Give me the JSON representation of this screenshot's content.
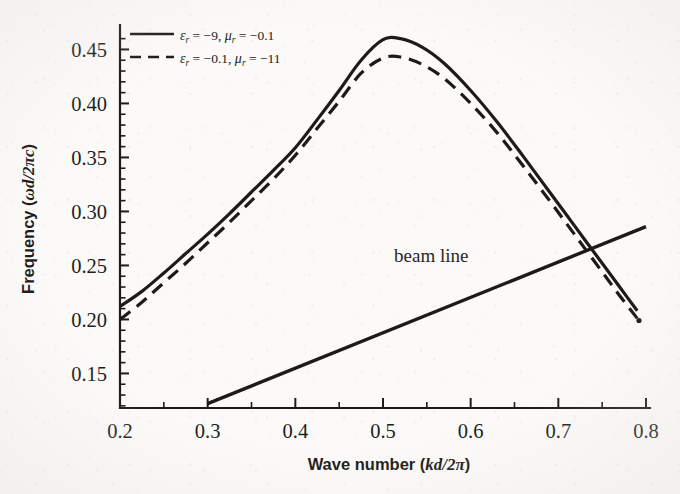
{
  "figure": {
    "background_color": "#fbfaf8",
    "ink_color": "#1d1b19",
    "style": "scanned-grayscale-figure"
  },
  "axes": {
    "x": {
      "label_prefix": "Wave number (",
      "label_symbol": "kd/2π",
      "label_suffix": ")",
      "label_full": "Wave number (kd/2π)",
      "ticks": [
        "0.2",
        "0.3",
        "0.4",
        "0.5",
        "0.6",
        "0.7",
        "0.8"
      ],
      "tick_values": [
        0.2,
        0.3,
        0.4,
        0.5,
        0.6,
        0.7,
        0.8
      ],
      "minor_ticks_per_interval": 1,
      "range": [
        0.2,
        0.8
      ]
    },
    "y": {
      "label_prefix": "Frequency (",
      "label_symbol": "ωd/2πc",
      "label_suffix": ")",
      "label_full": "Frequency (ωd/2πc)",
      "ticks": [
        "0.15",
        "0.20",
        "0.25",
        "0.30",
        "0.35",
        "0.40",
        "0.45"
      ],
      "tick_values": [
        0.15,
        0.2,
        0.25,
        0.3,
        0.35,
        0.4,
        0.45
      ],
      "minor_ticks_per_interval": 4,
      "range": [
        0.118,
        0.468
      ]
    }
  },
  "legend": {
    "position": "top-left-inside",
    "entries": [
      {
        "sample": "solid-line",
        "eps_symbol": "ε",
        "eps_sub": "r",
        "eps_value": "= −9",
        "separator": ",",
        "mu_symbol": "μ",
        "mu_sub": "r",
        "mu_value": "= −0.1",
        "text_full": "εr = −9, μr = −0.1"
      },
      {
        "sample": "dashed-line",
        "eps_symbol": "ε",
        "eps_sub": "r",
        "eps_value": "= −0.1",
        "separator": ",",
        "mu_symbol": "μ",
        "mu_sub": "r",
        "mu_value": "= −11",
        "text_full": "εr = −0.1, μr = −11"
      }
    ]
  },
  "annotations": [
    {
      "name": "beam-line-label",
      "text": "beam line",
      "x_data": 0.555,
      "y_data": 0.253
    }
  ],
  "chart_data": {
    "type": "line",
    "title": "",
    "xlabel": "Wave number (kd/2π)",
    "ylabel": "Frequency (ωd/2πc)",
    "xlim": [
      0.2,
      0.8
    ],
    "ylim": [
      0.118,
      0.468
    ],
    "grid": false,
    "legend_position": "upper left",
    "series": [
      {
        "name": "εr = −9, μr = −0.1",
        "style": "solid",
        "color": "#1d1b19",
        "x": [
          0.2,
          0.225,
          0.25,
          0.275,
          0.3,
          0.325,
          0.35,
          0.375,
          0.4,
          0.425,
          0.45,
          0.475,
          0.5,
          0.52,
          0.545,
          0.57,
          0.6,
          0.63,
          0.66,
          0.69,
          0.72,
          0.75,
          0.77,
          0.79
        ],
        "y": [
          0.212,
          0.226,
          0.243,
          0.261,
          0.279,
          0.298,
          0.318,
          0.338,
          0.359,
          0.385,
          0.412,
          0.44,
          0.459,
          0.46,
          0.452,
          0.437,
          0.412,
          0.383,
          0.351,
          0.318,
          0.285,
          0.252,
          0.23,
          0.208
        ]
      },
      {
        "name": "εr = −0.1, μr = −11",
        "style": "dashed",
        "color": "#1d1b19",
        "x": [
          0.2,
          0.225,
          0.25,
          0.275,
          0.3,
          0.325,
          0.35,
          0.375,
          0.4,
          0.425,
          0.45,
          0.475,
          0.5,
          0.52,
          0.545,
          0.57,
          0.6,
          0.63,
          0.66,
          0.69,
          0.72,
          0.75,
          0.77,
          0.79
        ],
        "y": [
          0.2,
          0.216,
          0.234,
          0.252,
          0.271,
          0.29,
          0.31,
          0.33,
          0.352,
          0.377,
          0.402,
          0.428,
          0.442,
          0.443,
          0.436,
          0.423,
          0.4,
          0.373,
          0.342,
          0.31,
          0.277,
          0.244,
          0.222,
          0.201
        ]
      },
      {
        "name": "beam line",
        "style": "solid",
        "color": "#1d1b19",
        "x": [
          0.3,
          0.8
        ],
        "y": [
          0.122,
          0.286
        ]
      }
    ]
  }
}
